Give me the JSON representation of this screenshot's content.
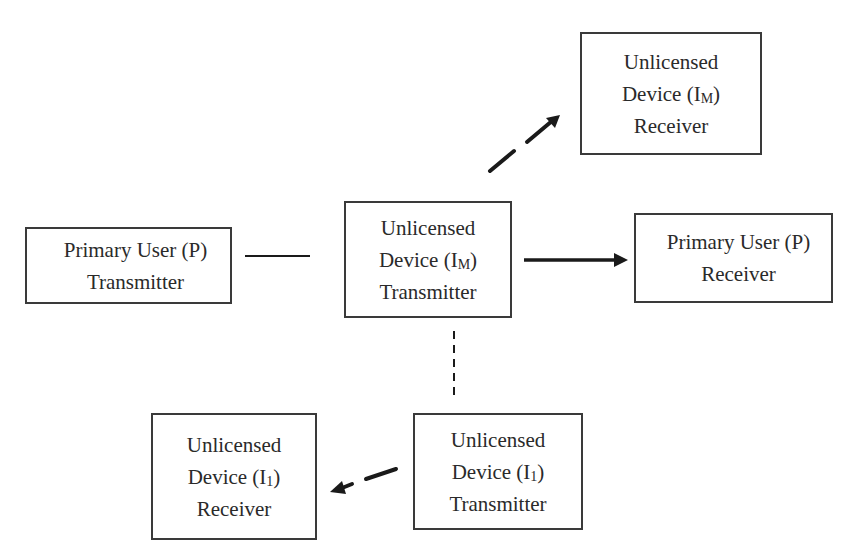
{
  "diagram": {
    "colors": {
      "stroke": "#1a1a1a",
      "box_border": "#3a3a3a",
      "text": "#2a2a2a",
      "background": "#ffffff"
    },
    "nodes": {
      "im_receiver": {
        "line1": "Unlicensed",
        "line2_prefix": "Device (I",
        "line2_sub": "M",
        "line2_suffix": ")",
        "line3": "Receiver"
      },
      "im_transmitter": {
        "line1": "Unlicensed",
        "line2_prefix": "Device (I",
        "line2_sub": "M",
        "line2_suffix": ")",
        "line3": "Transmitter"
      },
      "pu_transmitter": {
        "line1": "Primary User (P)",
        "line2": "Transmitter"
      },
      "pu_receiver": {
        "line1": "Primary User (P)",
        "line2": "Receiver"
      },
      "i1_receiver": {
        "line1": "Unlicensed",
        "line2_prefix": "Device (I",
        "line2_sub": "1",
        "line2_suffix": ")",
        "line3": "Receiver"
      },
      "i1_transmitter": {
        "line1": "Unlicensed",
        "line2_prefix": "Device (I",
        "line2_sub": "1",
        "line2_suffix": ")",
        "line3": "Transmitter"
      }
    },
    "edges": [
      {
        "from": "im_transmitter",
        "to": "im_receiver",
        "style": "dashed",
        "arrow": true
      },
      {
        "from": "pu_transmitter",
        "to": "im_transmitter",
        "style": "solid",
        "arrow": false
      },
      {
        "from": "im_transmitter",
        "to": "pu_receiver",
        "style": "solid",
        "arrow": true
      },
      {
        "from": "im_transmitter",
        "to": "i1_transmitter",
        "style": "dotted",
        "arrow": false
      },
      {
        "from": "i1_transmitter",
        "to": "i1_receiver",
        "style": "dashed",
        "arrow": true
      }
    ]
  }
}
